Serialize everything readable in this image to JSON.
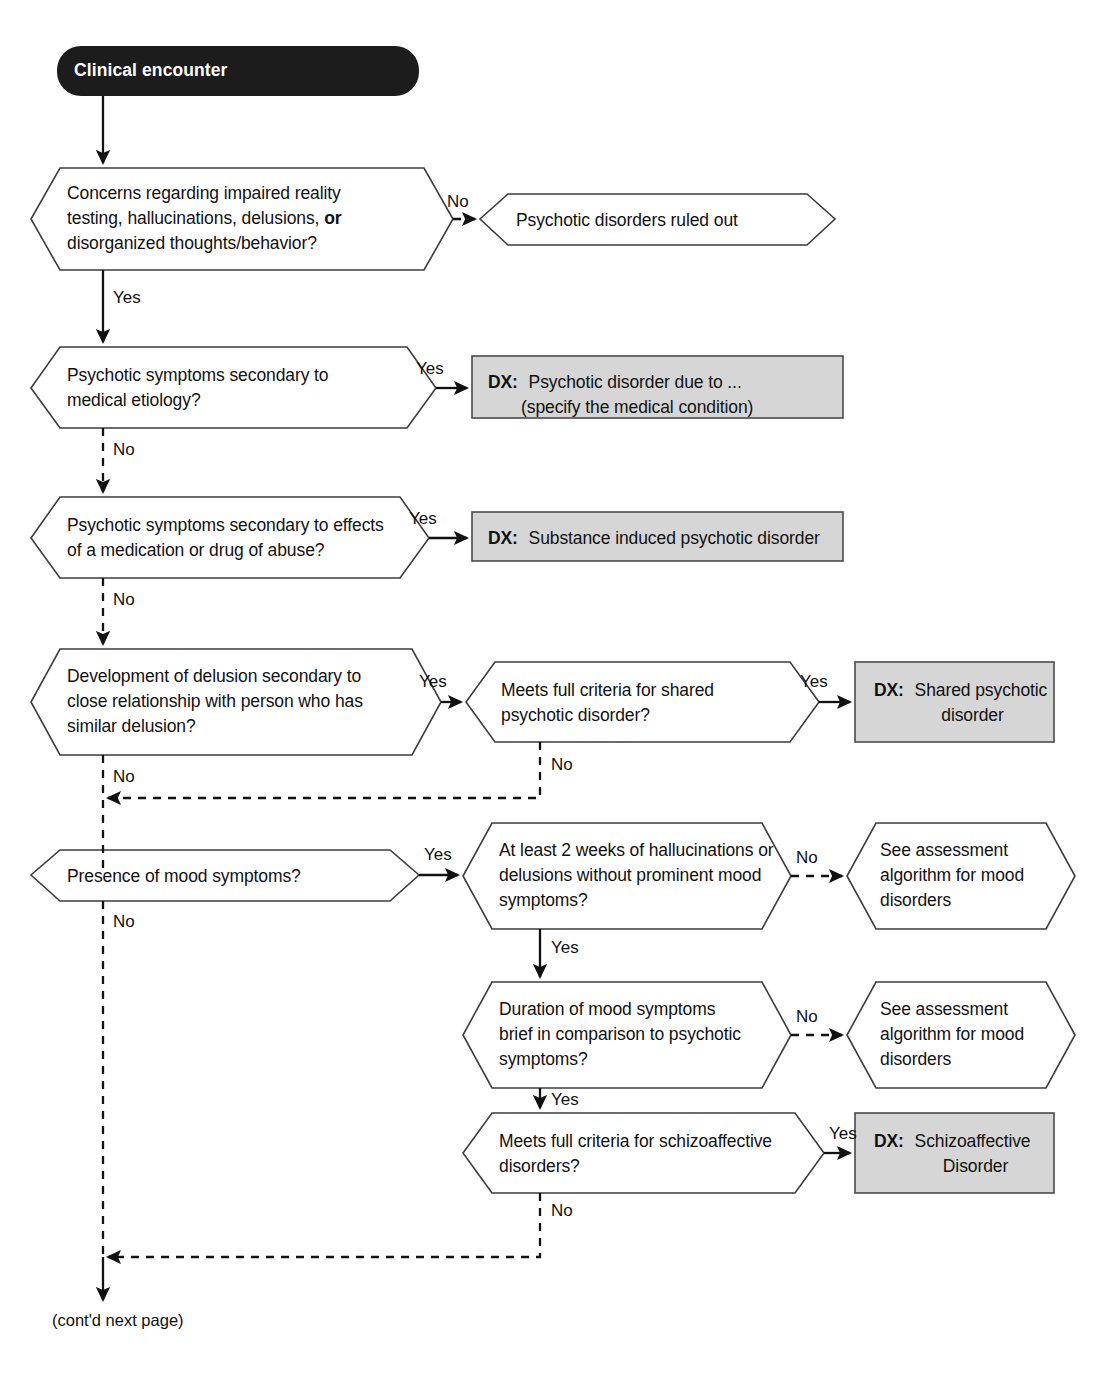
{
  "diagram": {
    "footnote": "(cont'd next page)",
    "colors": {
      "start_fill": "#1c1c1c",
      "start_text": "#ffffff",
      "decision_fill": "#ffffff",
      "decision_stroke": "#3d3d3d",
      "dx_fill": "#d6d6d6",
      "dx_stroke": "#4a4a4a",
      "line": "#111111"
    },
    "start": {
      "id": "start",
      "shape": "rounded-pill",
      "label": "Clinical encounter"
    },
    "nodes": [
      {
        "id": "d1",
        "shape": "hexagon",
        "lines": [
          "Concerns regarding impaired reality",
          "testing, hallucinations, delusions, |or|",
          "disorganized thoughts/behavior?"
        ]
      },
      {
        "id": "out1",
        "shape": "hexagon",
        "lines": [
          "Psychotic disorders ruled out"
        ]
      },
      {
        "id": "d2",
        "shape": "hexagon",
        "lines": [
          "Psychotic symptoms secondary to",
          "medical etiology?"
        ]
      },
      {
        "id": "dx1",
        "shape": "box",
        "prefix": "DX:",
        "lines": [
          "Psychotic disorder due to ...",
          "(specify the medical condition)"
        ]
      },
      {
        "id": "d3",
        "shape": "hexagon",
        "lines": [
          "Psychotic symptoms secondary to effects",
          "of a medication or drug of abuse?"
        ]
      },
      {
        "id": "dx2",
        "shape": "box",
        "prefix": "DX:",
        "lines": [
          "Substance induced psychotic disorder"
        ]
      },
      {
        "id": "d4",
        "shape": "hexagon",
        "lines": [
          "Development of delusion secondary to",
          "close relationship with person who has",
          "similar delusion?"
        ]
      },
      {
        "id": "d5",
        "shape": "hexagon",
        "lines": [
          "Meets full criteria for shared",
          "psychotic disorder?"
        ]
      },
      {
        "id": "dx3",
        "shape": "box",
        "prefix": "DX:",
        "lines": [
          "Shared psychotic",
          "disorder"
        ]
      },
      {
        "id": "d6",
        "shape": "hexagon",
        "lines": [
          "Presence of mood symptoms?"
        ]
      },
      {
        "id": "d7",
        "shape": "hexagon",
        "lines": [
          "At least 2 weeks of hallucinations or",
          "delusions without prominent mood",
          "symptoms?"
        ]
      },
      {
        "id": "out2",
        "shape": "hexagon",
        "lines": [
          "See assessment",
          "algorithm for mood",
          "disorders"
        ]
      },
      {
        "id": "d8",
        "shape": "hexagon",
        "lines": [
          "Duration of mood symptoms",
          "brief in comparison to psychotic",
          "symptoms?"
        ]
      },
      {
        "id": "out3",
        "shape": "hexagon",
        "lines": [
          "See assessment",
          "algorithm for mood",
          "disorders"
        ]
      },
      {
        "id": "d9",
        "shape": "hexagon",
        "lines": [
          "Meets full criteria for schizoaffective",
          "disorders?"
        ]
      },
      {
        "id": "dx4",
        "shape": "box",
        "prefix": "DX:",
        "lines": [
          "Schizoaffective",
          "Disorder"
        ]
      }
    ],
    "edge_labels": {
      "d1_no": "No",
      "d1_yes": "Yes",
      "d2_yes": "Yes",
      "d2_no": "No",
      "d3_yes": "Yes",
      "d3_no": "No",
      "d4_yes": "Yes",
      "d4_no": "No",
      "d5_yes": "Yes",
      "d5_no": "No",
      "d6_yes": "Yes",
      "d6_no": "No",
      "d7_no": "No",
      "d7_yes": "Yes",
      "d8_no": "No",
      "d8_yes": "Yes",
      "d9_yes": "Yes",
      "d9_no": "No"
    }
  }
}
